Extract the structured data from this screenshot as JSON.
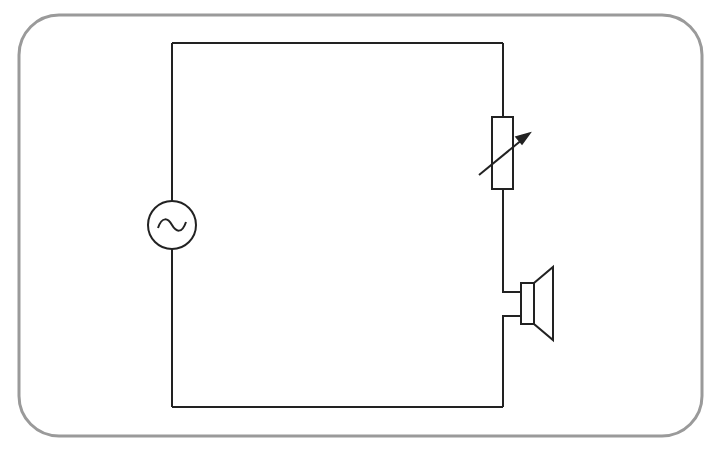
{
  "diagram": {
    "type": "circuit-schematic",
    "frame": {
      "stroke": "#9a9a9a",
      "fill": "#ffffff",
      "radius": 40
    },
    "wire_color": "#222222",
    "components": [
      {
        "id": "ac-source",
        "symbol": "alternating-current-source",
        "position": "left-branch"
      },
      {
        "id": "variable-resistor",
        "symbol": "rheostat",
        "position": "right-branch-upper"
      },
      {
        "id": "speaker",
        "symbol": "loudspeaker",
        "position": "right-branch-lower"
      }
    ],
    "connections": "series loop"
  }
}
